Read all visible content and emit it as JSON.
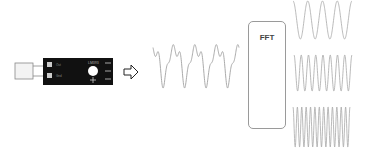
{
  "diagram": {
    "sensor": {
      "label": "sound-sensor-module",
      "board_color": "#111111",
      "pin_labels": [
        "Out",
        "Gnd"
      ],
      "chip_label": "LM393"
    },
    "fft_block": {
      "label": "FFT"
    },
    "arrows": [
      "sensor-to-signal",
      "fft-internal"
    ],
    "output_waves": [
      {
        "name": "low-frequency",
        "cycles": 4
      },
      {
        "name": "mid-frequency",
        "cycles": 8
      },
      {
        "name": "high-frequency",
        "cycles": 13
      }
    ],
    "line_color": "#999999"
  }
}
